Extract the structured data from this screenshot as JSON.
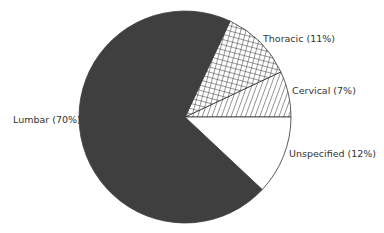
{
  "chart_data": {
    "type": "pie",
    "title": "",
    "categories": [
      "Lumbar",
      "Thoracic",
      "Cervical",
      "Unspecified"
    ],
    "values": [
      70,
      11,
      7,
      12
    ],
    "labels": [
      "Lumbar (70%)",
      "Thoracic (11%)",
      "Cervical (7%)",
      "Unspecified (12%)"
    ],
    "fills": [
      "solid-dark",
      "crosshatch",
      "diagonal-hatch",
      "white"
    ],
    "colors": [
      "#3f3f3f",
      "#ffffff",
      "#ffffff",
      "#ffffff"
    ],
    "start_angle_deg_from_east_ccw": 0,
    "direction": "counterclockwise from 3 o'clock: Cervical, Thoracic, Lumbar, Unspecified",
    "legend": "inline labels"
  },
  "labels": {
    "lumbar": "Lumbar (70%)",
    "thoracic": "Thoracic (11%)",
    "cervical": "Cervical (7%)",
    "unspecified": "Unspecified (12%)"
  }
}
